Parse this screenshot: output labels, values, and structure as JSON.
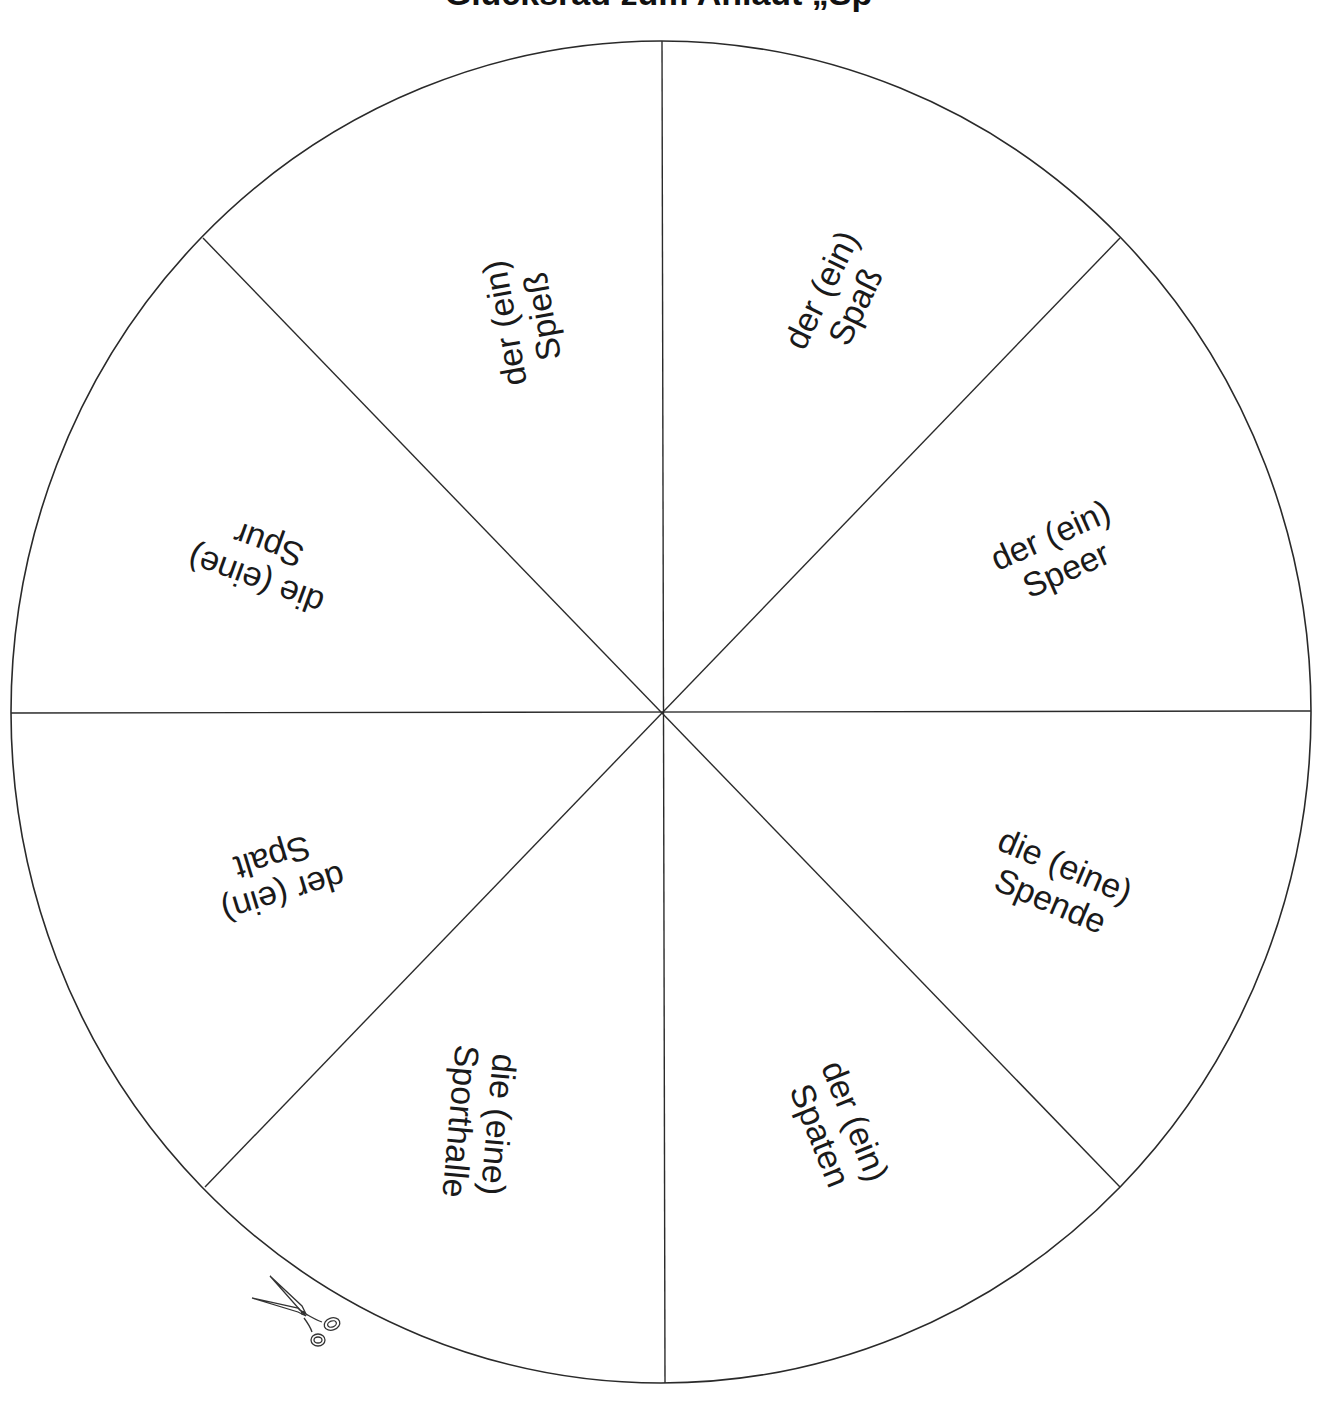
{
  "title": "Glücksrad zum Anlaut „Sp",
  "wheel": {
    "line_color": "#2a2a2a",
    "segments": [
      {
        "line1": "der (ein)",
        "line2": "Spaß"
      },
      {
        "line1": "der (ein)",
        "line2": "Speer"
      },
      {
        "line1": "die (eine)",
        "line2": "Spende"
      },
      {
        "line1": "der (ein)",
        "line2": "Spaten"
      },
      {
        "line1": "die (eine)",
        "line2": "Sporthalle"
      },
      {
        "line1": "der (ein)",
        "line2": "Spalt"
      },
      {
        "line1": "die (eine)",
        "line2": "Spur"
      },
      {
        "line1": "der (ein)",
        "line2": "Spieß"
      }
    ]
  },
  "icons": {
    "cut_marker": "scissors-icon"
  }
}
